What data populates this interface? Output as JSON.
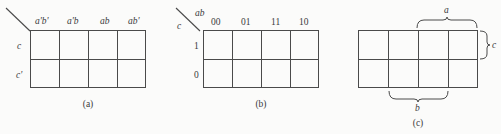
{
  "figure": {
    "line_color": "#4a4a4a",
    "text_color": "#3a3a3a",
    "background": "#fbfbfa"
  },
  "maps": [
    {
      "id": "a",
      "caption": "(a)",
      "columns": 4,
      "rows": 2,
      "column_labels": [
        "a'b'",
        "a'b",
        "ab",
        "ab'"
      ],
      "row_labels": [
        "c",
        "c'"
      ],
      "corner_diagonal": true,
      "corner_top_label": "",
      "corner_bottom_label": ""
    },
    {
      "id": "b",
      "caption": "(b)",
      "columns": 4,
      "rows": 2,
      "column_labels": [
        "00",
        "01",
        "11",
        "10"
      ],
      "row_labels": [
        "1",
        "0"
      ],
      "corner_diagonal": true,
      "corner_top_label": "ab",
      "corner_bottom_label": "c"
    },
    {
      "id": "c",
      "caption": "(c)",
      "columns": 4,
      "rows": 2,
      "column_labels": [],
      "row_labels": [],
      "corner_diagonal": false,
      "braces": [
        {
          "name": "a",
          "label": "a",
          "orientation": "top",
          "spans": "columns 3-4"
        },
        {
          "name": "b",
          "label": "b",
          "orientation": "bottom",
          "spans": "columns 2-3"
        },
        {
          "name": "c",
          "label": "c",
          "orientation": "right",
          "spans": "row 1"
        }
      ]
    }
  ]
}
